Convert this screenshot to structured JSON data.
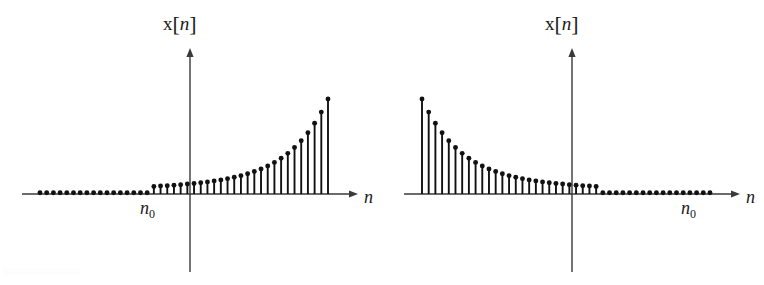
{
  "figure": {
    "background_color": "#ffffff",
    "ink_color": "#111111",
    "axis_color": "#3a3a3a"
  },
  "panels": [
    {
      "id": "left",
      "name": "growing-exponential-panel",
      "y_axis_label": {
        "function": "x",
        "open_bracket": "[",
        "variable": "n",
        "close_bracket": "]"
      },
      "x_axis_label": "n",
      "origin_label": {
        "variable": "n",
        "subscript": "0"
      },
      "origin_label_x": 148,
      "axis": {
        "x_start": 22,
        "x_end": 350,
        "arrow_x": 358,
        "baseline_y": 194,
        "y_top": 48,
        "y_bottom": 272,
        "y_axis_x": 190
      }
    },
    {
      "id": "right",
      "name": "decaying-exponential-panel",
      "y_axis_label": {
        "function": "x",
        "open_bracket": "[",
        "variable": "n",
        "close_bracket": "]"
      },
      "x_axis_label": "n",
      "origin_label": {
        "variable": "n",
        "subscript": "0"
      },
      "origin_label_x": 307,
      "axis": {
        "x_start": 22,
        "x_end": 350,
        "arrow_x": 358,
        "baseline_y": 194,
        "y_top": 48,
        "y_bottom": 272,
        "y_axis_x": 190
      }
    }
  ],
  "chart_data": [
    {
      "type": "line",
      "subtype": "stem",
      "id": "left",
      "title": "",
      "xlabel": "n",
      "ylabel": "x[n]",
      "annotations": [
        "n_0"
      ],
      "grid": false,
      "legend": null,
      "description": "Right-sided growing exponential: x[n] = 0 for n < n0, grows geometrically for n >= n0",
      "n0_index": 17,
      "x": [
        0,
        1,
        2,
        3,
        4,
        5,
        6,
        7,
        8,
        9,
        10,
        11,
        12,
        13,
        14,
        15,
        16,
        17,
        18,
        19,
        20,
        21,
        22,
        23,
        24,
        25,
        26,
        27,
        28,
        29,
        30,
        31,
        32,
        33,
        34,
        35,
        36,
        37,
        38,
        39,
        40,
        41,
        42,
        43
      ],
      "values": [
        0,
        0,
        0,
        0,
        0,
        0,
        0,
        0,
        0,
        0,
        0,
        0,
        0,
        0,
        0,
        0,
        0,
        6.0,
        6.3,
        6.6,
        7.0,
        7.4,
        7.9,
        8.4,
        9.0,
        9.6,
        10.4,
        11.2,
        12.2,
        13.3,
        14.6,
        16.1,
        17.9,
        19.9,
        22.3,
        25.1,
        28.4,
        32.3,
        36.9,
        42.3,
        48.7,
        56.2,
        65.1,
        75.5
      ],
      "ylim": [
        0,
        100
      ],
      "xlim": [
        0,
        45
      ]
    },
    {
      "type": "line",
      "subtype": "stem",
      "id": "right",
      "title": "",
      "xlabel": "n",
      "ylabel": "x[n]",
      "annotations": [
        "n_0"
      ],
      "grid": false,
      "legend": null,
      "description": "Left-sided decaying exponential: decays geometrically for n <= n0, and x[n] = 0 for n > n0",
      "n0_index": 26,
      "x": [
        0,
        1,
        2,
        3,
        4,
        5,
        6,
        7,
        8,
        9,
        10,
        11,
        12,
        13,
        14,
        15,
        16,
        17,
        18,
        19,
        20,
        21,
        22,
        23,
        24,
        25,
        26,
        27,
        28,
        29,
        30,
        31,
        32,
        33,
        34,
        35,
        36,
        37,
        38,
        39,
        40,
        41,
        42,
        43
      ],
      "values": [
        75.5,
        65.1,
        56.2,
        48.7,
        42.3,
        36.9,
        32.3,
        28.4,
        25.1,
        22.3,
        19.9,
        17.9,
        16.1,
        14.6,
        13.3,
        12.2,
        11.2,
        10.4,
        9.6,
        9.0,
        8.4,
        7.9,
        7.4,
        7.0,
        6.6,
        6.3,
        6.0,
        0,
        0,
        0,
        0,
        0,
        0,
        0,
        0,
        0,
        0,
        0,
        0,
        0,
        0,
        0,
        0,
        0
      ],
      "ylim": [
        0,
        100
      ],
      "xlim": [
        0,
        45
      ]
    }
  ]
}
